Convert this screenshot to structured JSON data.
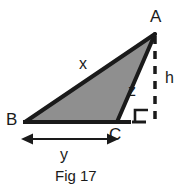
{
  "figure": {
    "caption": "Fig 17",
    "type": "geometry-diagram",
    "shape": "right-triangle-with-altitude",
    "background_color": "#ffffff",
    "fill_color": "#8f8f8f",
    "stroke_color": "#1a1a1a",
    "vertices": [
      {
        "name": "A",
        "label": "A",
        "x": 155,
        "y": 34
      },
      {
        "name": "B",
        "label": "B",
        "x": 25,
        "y": 122
      },
      {
        "name": "C",
        "label": "C",
        "x": 117,
        "y": 122
      }
    ],
    "side_labels": [
      {
        "name": "x",
        "label": "x",
        "describes": "side-BA"
      },
      {
        "name": "z",
        "label": "z",
        "describes": "side-CA"
      },
      {
        "name": "h",
        "label": "h",
        "describes": "vertical-dashed-height"
      },
      {
        "name": "y",
        "label": "y",
        "describes": "horizontal-base-arrow"
      }
    ],
    "annotations": {
      "right_angle_marker": true,
      "dashed_height_line": true,
      "base_dimension_arrow": true
    }
  }
}
